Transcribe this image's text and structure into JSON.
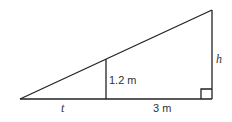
{
  "diagram": {
    "type": "similar-triangles",
    "labels": {
      "post_height": "1.2 m",
      "distance_base": "3 m",
      "shadow_length": "t",
      "tall_height": "h"
    },
    "stroke_color": "#222222"
  }
}
